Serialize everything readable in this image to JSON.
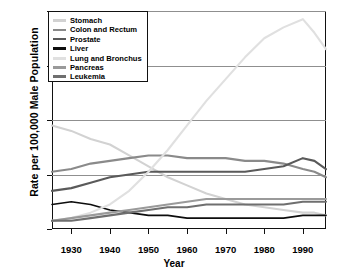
{
  "chart_data": {
    "type": "line",
    "title": "",
    "xlabel": "Year",
    "ylabel": "Rate per 100,000 Male Population",
    "xlim": [
      1925,
      1996
    ],
    "ylim": [
      0,
      80
    ],
    "xticks": [
      1930,
      1940,
      1950,
      1960,
      1970,
      1980,
      1990
    ],
    "yticks": [
      0,
      20,
      40,
      60,
      80
    ],
    "grid": true,
    "legend_position": "top-left",
    "x": [
      1925,
      1930,
      1935,
      1940,
      1945,
      1950,
      1955,
      1960,
      1965,
      1970,
      1975,
      1980,
      1985,
      1990,
      1993,
      1996
    ],
    "series": [
      {
        "name": "Stomach",
        "color": "#d2d2d2",
        "values": [
          38,
          36,
          33,
          31,
          27,
          23,
          19,
          16,
          13,
          11,
          9,
          8,
          7,
          6,
          6,
          5
        ]
      },
      {
        "name": "Colon and Rectum",
        "color": "#8a8a8a",
        "values": [
          21,
          22,
          24,
          25,
          26,
          27,
          27,
          26,
          26,
          26,
          25,
          25,
          24,
          22,
          21,
          19
        ]
      },
      {
        "name": "Prostate",
        "color": "#5a5a5a",
        "values": [
          14,
          15,
          17,
          19,
          20,
          21,
          21,
          21,
          21,
          21,
          21,
          22,
          23,
          26,
          25,
          22
        ]
      },
      {
        "name": "Liver",
        "color": "#0d0d0d",
        "values": [
          9,
          10,
          9,
          7,
          6,
          5,
          5,
          4,
          4,
          4,
          4,
          4,
          4,
          5,
          5,
          5
        ]
      },
      {
        "name": "Lung and Bronchus",
        "color": "#e0e0e0",
        "values": [
          3,
          4,
          6,
          9,
          14,
          21,
          29,
          38,
          47,
          55,
          63,
          70,
          74,
          77,
          72,
          66
        ]
      },
      {
        "name": "Pancreas",
        "color": "#9a9a9a",
        "values": [
          3,
          4,
          5,
          6,
          7,
          8,
          9,
          10,
          11,
          11,
          11,
          11,
          11,
          11,
          11,
          11
        ]
      },
      {
        "name": "Leukemia",
        "color": "#6f6f6f",
        "values": [
          3,
          3,
          4,
          5,
          6,
          7,
          8,
          8,
          9,
          9,
          9,
          9,
          9,
          10,
          10,
          10
        ]
      }
    ]
  },
  "legend": {
    "items": [
      {
        "label": "Stomach",
        "color": "#d2d2d2",
        "weight": 2.2
      },
      {
        "label": "Colon and Rectum",
        "color": "#8a8a8a",
        "weight": 2.2
      },
      {
        "label": "Prostate",
        "color": "#5a5a5a",
        "weight": 2.4
      },
      {
        "label": "Liver",
        "color": "#0d0d0d",
        "weight": 3.0
      },
      {
        "label": "Lung and Bronchus",
        "color": "#e0e0e0",
        "weight": 3.0
      },
      {
        "label": "Pancreas",
        "color": "#9a9a9a",
        "weight": 3.0
      },
      {
        "label": "Leukemia",
        "color": "#6f6f6f",
        "weight": 3.0
      }
    ]
  }
}
